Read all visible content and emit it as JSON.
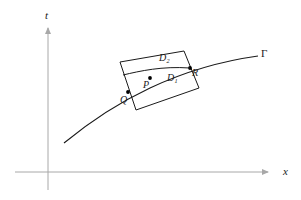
{
  "figure": {
    "type": "math-diagram",
    "background_color": "#ffffff",
    "axis_color": "#a8a8a8",
    "curve_color": "#1a1a1a",
    "polygon_color": "#1a1a1a",
    "point_color": "#000000"
  },
  "axes": {
    "x_axis_label": "x",
    "t_axis_label": "t",
    "x_axis": {
      "x1": 15,
      "y1": 172,
      "x2": 268,
      "y2": 172
    },
    "t_axis": {
      "x1": 48,
      "y1": 190,
      "x2": 48,
      "y2": 28
    }
  },
  "curve": {
    "label": "Γ",
    "label_name": "Gamma",
    "path": "M 64 143 C 92 120, 118 103, 150 88 C 182 73, 222 61, 258 56"
  },
  "polygon": {
    "outline": "M 120 62 L 184 51 L 199 88 L 136 110 Z",
    "divider": "M 123 75 C 140 71, 162 66, 190 68",
    "region_lower_label": "D",
    "region_lower_sub": "1",
    "region_upper_label": "D",
    "region_upper_sub": "2"
  },
  "points": [
    {
      "name": "Q",
      "label": "Q",
      "x": 128,
      "y": 92
    },
    {
      "name": "P",
      "label": "P",
      "x": 150,
      "y": 78
    },
    {
      "name": "R",
      "label": "R",
      "x": 190,
      "y": 68
    }
  ]
}
